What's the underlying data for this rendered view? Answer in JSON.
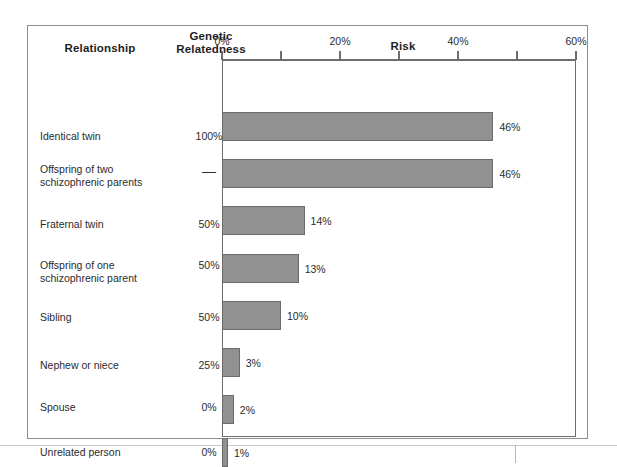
{
  "figure": {
    "headers": {
      "relationship": "Relationship",
      "genetic_relatedness_line1": "Genetic",
      "genetic_relatedness_line2": "Relatedness",
      "risk": "Risk"
    }
  },
  "chart_data": {
    "type": "bar",
    "orientation": "horizontal",
    "title": "Risk",
    "xlabel": "Risk",
    "ylabel": "Relationship",
    "xlim": [
      0,
      60
    ],
    "grid": false,
    "legend": null,
    "tick_values": [
      0,
      10,
      20,
      30,
      40,
      50,
      60
    ],
    "tick_labels": [
      "0%",
      "",
      "20%",
      "",
      "40%",
      "",
      "60%"
    ],
    "axis_unit": "%",
    "categories": [
      "Identical twin",
      "Offspring of two schizophrenic parents",
      "Fraternal twin",
      "Offspring of one schizophrenic parent",
      "Sibling",
      "Nephew or niece",
      "Spouse",
      "Unrelated person"
    ],
    "values": [
      46,
      46,
      14,
      13,
      10,
      3,
      2,
      1
    ],
    "data_labels": [
      "46%",
      "46%",
      "14%",
      "13%",
      "10%",
      "3%",
      "2%",
      "1%"
    ],
    "genetic_relatedness": [
      "100%",
      "—",
      "50%",
      "50%",
      "50%",
      "25%",
      "0%",
      "0%"
    ],
    "bar_color": "#919191",
    "bar_border_color": "#6b6b6b",
    "axis_color": "#6d6d6d",
    "rows": [
      {
        "label_line1": "Identical twin",
        "label_line2": "",
        "relatedness": "100%",
        "value": 46,
        "value_label": "46%",
        "label_top": 104,
        "bar_top": 86
      },
      {
        "label_line1": "Offspring of two",
        "label_line2": "schizophrenic parents",
        "relatedness": "—",
        "value": 46,
        "value_label": "46%",
        "label_top": 137,
        "bar_top": 133
      },
      {
        "label_line1": "Fraternal twin",
        "label_line2": "",
        "relatedness": "50%",
        "value": 14,
        "value_label": "14%",
        "label_top": 192,
        "bar_top": 180
      },
      {
        "label_line1": "Offspring of one",
        "label_line2": "schizophrenic parent",
        "relatedness": "50%",
        "value": 13,
        "value_label": "13%",
        "label_top": 233,
        "bar_top": 228
      },
      {
        "label_line1": "Sibling",
        "label_line2": "",
        "relatedness": "50%",
        "value": 10,
        "value_label": "10%",
        "label_top": 285,
        "bar_top": 275
      },
      {
        "label_line1": "Nephew or niece",
        "label_line2": "",
        "relatedness": "25%",
        "value": 3,
        "value_label": "3%",
        "label_top": 333,
        "bar_top": 322
      },
      {
        "label_line1": "Spouse",
        "label_line2": "",
        "relatedness": "0%",
        "value": 2,
        "value_label": "2%",
        "label_top": 375,
        "bar_top": 369
      },
      {
        "label_line1": "Unrelated person",
        "label_line2": "",
        "relatedness": "0%",
        "value": 1,
        "value_label": "1%",
        "label_top": 420,
        "bar_top": 412
      }
    ]
  }
}
